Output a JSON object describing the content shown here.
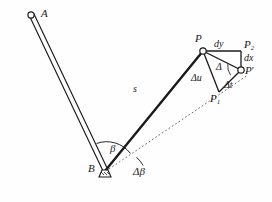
{
  "figure": {
    "type": "geometric-diagram",
    "background_color": "#fefefe",
    "ink_color": "#1a1a1a"
  },
  "points": {
    "A": "A",
    "B": "B",
    "P": "P",
    "P_prime": "P",
    "P_prime_mark": "′",
    "P1_base": "P",
    "P1_sub": "1",
    "P2_base": "P",
    "P2_sub": "2"
  },
  "segments": {
    "s": "s",
    "dy": "dy",
    "dx": "dx",
    "delta_u": "Δu",
    "delta_t": "Δt",
    "delta": "Δ"
  },
  "angles": {
    "beta": "β",
    "delta_beta": "Δβ"
  },
  "geometry": {
    "A": [
      31,
      16
    ],
    "B": [
      105,
      172
    ],
    "P": [
      203,
      51
    ],
    "P_prime": [
      241,
      70
    ],
    "P1": [
      219,
      92
    ],
    "P2": [
      241,
      51
    ],
    "arm_AB_width": 4,
    "arm_BP_width": 2.6,
    "dotted_line_from": [
      105,
      172
    ],
    "dotted_line_to": [
      247,
      76
    ]
  }
}
